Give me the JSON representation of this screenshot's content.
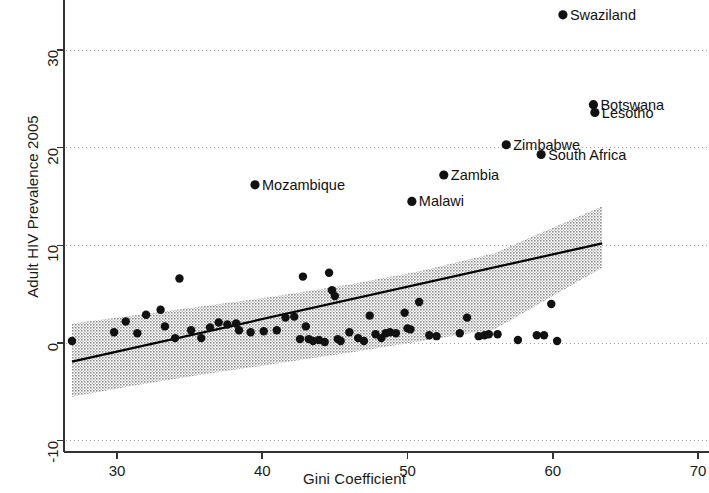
{
  "chart_data": {
    "type": "scatter",
    "title": "",
    "xlabel": "Gini Coefficient",
    "ylabel": "Adult HIV Prevalence 2005",
    "xlim": [
      26.5,
      71.5
    ],
    "ylim": [
      -12.5,
      35.5
    ],
    "xticks": [
      30,
      40,
      50,
      60,
      70
    ],
    "yticks": [
      -10,
      0,
      10,
      20,
      30
    ],
    "xtick_labels": [
      "30",
      "40",
      "50",
      "60",
      "70"
    ],
    "ytick_labels": [
      "-10",
      "0",
      "10",
      "20",
      "30"
    ],
    "grid": "horizontal-dotted",
    "legend": "none",
    "marker_color": "#111111",
    "fit_line_color": "#000000",
    "ci_band_color": "#9a9a9a",
    "fit_line": {
      "x": [
        26.9,
        63.4
      ],
      "y": [
        -1.9,
        10.2
      ]
    },
    "ci_band": {
      "x": [
        26.9,
        31.0,
        36.0,
        41.0,
        46.0,
        51.0,
        56.0,
        63.4
      ],
      "upper": [
        2.0,
        2.8,
        3.8,
        4.8,
        6.0,
        7.4,
        9.2,
        14.0
      ],
      "lower": [
        -5.5,
        -4.4,
        -3.2,
        -2.1,
        -1.0,
        0.2,
        1.4,
        7.7
      ]
    },
    "labeled_points": [
      {
        "label": "Swaziland",
        "x": 60.7,
        "y": 33.6,
        "label_side": "right"
      },
      {
        "label": "Botswana",
        "x": 62.8,
        "y": 24.4,
        "label_side": "right"
      },
      {
        "label": "Lesotho",
        "x": 62.9,
        "y": 23.6,
        "label_side": "right"
      },
      {
        "label": "Zimbabwe",
        "x": 56.8,
        "y": 20.3,
        "label_side": "right"
      },
      {
        "label": "South Africa",
        "x": 59.2,
        "y": 19.3,
        "label_side": "right"
      },
      {
        "label": "Zambia",
        "x": 52.5,
        "y": 17.2,
        "label_side": "right"
      },
      {
        "label": "Malawi",
        "x": 50.3,
        "y": 14.5,
        "label_side": "right"
      },
      {
        "label": "Mozambique",
        "x": 39.5,
        "y": 16.2,
        "label_side": "right"
      }
    ],
    "points": [
      {
        "x": 26.9,
        "y": 0.2
      },
      {
        "x": 29.8,
        "y": 1.1
      },
      {
        "x": 30.6,
        "y": 2.2
      },
      {
        "x": 31.4,
        "y": 1.0
      },
      {
        "x": 32.0,
        "y": 2.9
      },
      {
        "x": 33.0,
        "y": 3.4
      },
      {
        "x": 33.3,
        "y": 1.7
      },
      {
        "x": 34.0,
        "y": 0.5
      },
      {
        "x": 34.3,
        "y": 6.6
      },
      {
        "x": 35.1,
        "y": 1.3
      },
      {
        "x": 35.8,
        "y": 0.5
      },
      {
        "x": 36.4,
        "y": 1.6
      },
      {
        "x": 37.0,
        "y": 2.1
      },
      {
        "x": 37.6,
        "y": 1.9
      },
      {
        "x": 38.2,
        "y": 2.0
      },
      {
        "x": 38.4,
        "y": 1.3
      },
      {
        "x": 39.2,
        "y": 1.1
      },
      {
        "x": 40.1,
        "y": 1.2
      },
      {
        "x": 41.0,
        "y": 1.3
      },
      {
        "x": 41.6,
        "y": 2.6
      },
      {
        "x": 42.2,
        "y": 2.7
      },
      {
        "x": 42.6,
        "y": 0.4
      },
      {
        "x": 42.8,
        "y": 6.8
      },
      {
        "x": 43.0,
        "y": 1.7
      },
      {
        "x": 43.2,
        "y": 0.4
      },
      {
        "x": 43.5,
        "y": 0.2
      },
      {
        "x": 43.9,
        "y": 0.3
      },
      {
        "x": 44.3,
        "y": 0.1
      },
      {
        "x": 44.6,
        "y": 7.2
      },
      {
        "x": 44.8,
        "y": 5.4
      },
      {
        "x": 45.0,
        "y": 4.8
      },
      {
        "x": 45.2,
        "y": 0.4
      },
      {
        "x": 45.4,
        "y": 0.2
      },
      {
        "x": 46.0,
        "y": 1.1
      },
      {
        "x": 46.6,
        "y": 0.5
      },
      {
        "x": 47.0,
        "y": 0.2
      },
      {
        "x": 47.4,
        "y": 2.8
      },
      {
        "x": 47.8,
        "y": 0.9
      },
      {
        "x": 48.2,
        "y": 0.5
      },
      {
        "x": 48.5,
        "y": 1.0
      },
      {
        "x": 48.8,
        "y": 1.1
      },
      {
        "x": 49.2,
        "y": 1.0
      },
      {
        "x": 49.8,
        "y": 3.1
      },
      {
        "x": 50.0,
        "y": 1.5
      },
      {
        "x": 50.2,
        "y": 1.4
      },
      {
        "x": 50.8,
        "y": 4.2
      },
      {
        "x": 51.5,
        "y": 0.8
      },
      {
        "x": 52.0,
        "y": 0.7
      },
      {
        "x": 53.6,
        "y": 1.0
      },
      {
        "x": 54.1,
        "y": 2.6
      },
      {
        "x": 54.9,
        "y": 0.7
      },
      {
        "x": 55.3,
        "y": 0.8
      },
      {
        "x": 55.6,
        "y": 0.9
      },
      {
        "x": 56.2,
        "y": 0.9
      },
      {
        "x": 57.6,
        "y": 0.3
      },
      {
        "x": 58.9,
        "y": 0.8
      },
      {
        "x": 59.4,
        "y": 0.8
      },
      {
        "x": 59.9,
        "y": 4.0
      },
      {
        "x": 60.3,
        "y": 0.2
      }
    ]
  }
}
